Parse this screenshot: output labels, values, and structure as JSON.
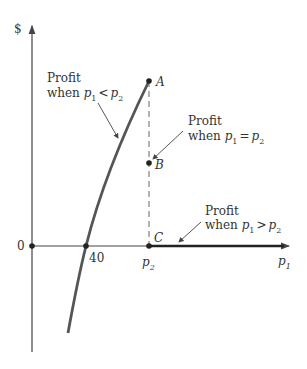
{
  "diagram": {
    "type": "economics-profit-diagram",
    "axes": {
      "y_label": "$",
      "x_label": "p",
      "x_label_sub": "1",
      "origin_label": "0"
    },
    "ticks": {
      "forty": "40",
      "p2": "p",
      "p2_sub": "2"
    },
    "points": [
      {
        "label": "A"
      },
      {
        "label": "B"
      },
      {
        "label": "C"
      }
    ],
    "annotations": [
      {
        "line1": "Profit",
        "line2_prefix": "when ",
        "var1": "p",
        "sub1": "1",
        "op": "<",
        "var2": "p",
        "sub2": "2"
      },
      {
        "line1": "Profit",
        "line2_prefix": "when ",
        "var1": "p",
        "sub1": "1",
        "op": "=",
        "var2": "p",
        "sub2": "2"
      },
      {
        "line1": "Profit",
        "line2_prefix": "when ",
        "var1": "p",
        "sub1": "1",
        "op": ">",
        "var2": "p",
        "sub2": "2"
      }
    ],
    "colors": {
      "axis": "#444444",
      "curve": "#555555",
      "text": "#333333"
    }
  }
}
